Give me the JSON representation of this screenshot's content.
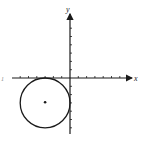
{
  "diagram": {
    "type": "coordinate-plane",
    "x_axis_label": "x",
    "y_axis_label": "y",
    "left_edge_label": "1",
    "origin_px": [
      70,
      78
    ],
    "unit_px": 8.3,
    "x_ticks": [
      -6,
      -5,
      -4,
      -3,
      -2,
      -1,
      1,
      2,
      3,
      4,
      5,
      6
    ],
    "y_ticks": [
      -6,
      -5,
      -4,
      -3,
      -2,
      -1,
      1,
      2,
      3,
      4,
      5,
      6
    ],
    "circle": {
      "center": [
        -3,
        -3
      ],
      "radius": 3,
      "center_marked": true
    },
    "colors": {
      "stroke": "#1a1a1a",
      "background": "#ffffff"
    }
  }
}
